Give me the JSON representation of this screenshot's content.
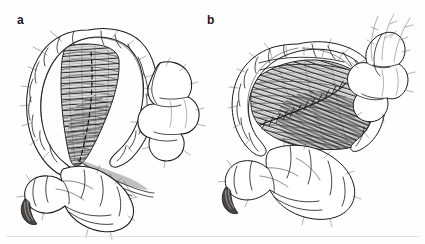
{
  "figure": {
    "background_color": "#fefefe",
    "ink_color": "#1b1b1b",
    "shading_color": "#8d8d8d",
    "stump_color": "#4a4644",
    "rule_color": "#e2e2e2",
    "width": 425,
    "height": 244
  },
  "panels": [
    {
      "label": "a",
      "name": "panel-a",
      "caption_text": "a",
      "description": "Twisted elongated sigmoid loop with hatched mesenteric base and dashed incision line",
      "elements": {
        "bowel_loop": "colon-loop-twisted",
        "mesentery": "mesentery-hatched-vertical",
        "incision": "dashed-incision-line",
        "stump": "dark-cut-bowel-end",
        "haustra_count": 14,
        "vessel_count": 22
      }
    },
    {
      "label": "b",
      "name": "panel-b",
      "caption_text": "b",
      "description": "Detorsed broadened sigmoid loop with obliquely hatched mesentery and sutured plication line",
      "elements": {
        "bowel_loop": "colon-loop-detorsed",
        "mesentery": "mesentery-hatched-oblique",
        "suture": "sutured-plication-line",
        "stump": "dark-cut-bowel-end",
        "haustra_count": 15,
        "vessel_count": 20
      }
    }
  ]
}
